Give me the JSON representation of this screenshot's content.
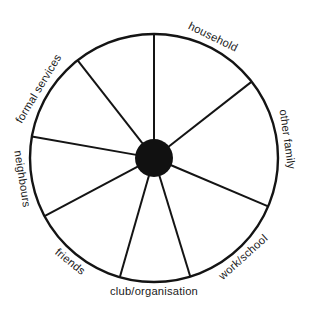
{
  "diagram": {
    "type": "social-network-circle-map",
    "title": "",
    "background_color": "#ffffff",
    "line_color": "#141414",
    "hub_color": "#111111",
    "text_color": "#1a1a1a",
    "geometry": {
      "center_x": 154,
      "center_y": 158,
      "outer_radius": 124,
      "hub_radius": 19,
      "rim_stroke_width": 2.4,
      "spoke_stroke_width": 2.0,
      "label_radius": 134
    },
    "sectors": [
      {
        "id": "household",
        "label": "household",
        "start_angle": 0,
        "end_angle": 52,
        "mid_angle": 26,
        "label_flip": false
      },
      {
        "id": "other-family",
        "label": "other family",
        "start_angle": 52,
        "end_angle": 113,
        "mid_angle": 82,
        "label_flip": false
      },
      {
        "id": "work-school",
        "label": "work/school",
        "start_angle": 113,
        "end_angle": 163,
        "mid_angle": 138,
        "label_flip": true
      },
      {
        "id": "club-organisation",
        "label": "club/organisation",
        "start_angle": 163,
        "end_angle": 196,
        "mid_angle": 180,
        "label_flip": true
      },
      {
        "id": "friends",
        "label": "friends",
        "start_angle": 196,
        "end_angle": 242,
        "mid_angle": 219,
        "label_flip": true
      },
      {
        "id": "neighbours",
        "label": "neighbours",
        "start_angle": 242,
        "end_angle": 280,
        "mid_angle": 261,
        "label_flip": true
      },
      {
        "id": "formal-services",
        "label": "formal services",
        "start_angle": 280,
        "end_angle": 322,
        "mid_angle": 301,
        "label_flip": false
      },
      {
        "id": "unlabelled-sector",
        "label": "",
        "start_angle": 322,
        "end_angle": 360,
        "mid_angle": 341,
        "label_flip": false
      }
    ],
    "spoke_angles": [
      0,
      52,
      113,
      163,
      196,
      242,
      280,
      322
    ]
  }
}
